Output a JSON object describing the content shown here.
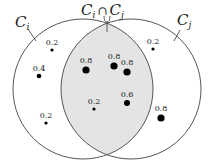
{
  "diagram": {
    "type": "venn",
    "sets": [
      {
        "id": "ci",
        "label": "C",
        "sub": "i"
      },
      {
        "id": "cj",
        "label": "C",
        "sub": "j"
      }
    ],
    "intersection_label": {
      "a": "C",
      "a_sub": "i",
      "op": "∩",
      "b": "C",
      "b_sub": "j"
    },
    "colors": {
      "stroke": "#555555",
      "intersection_fill": "#e4e4e4",
      "point": "#000000"
    },
    "points": [
      {
        "region": "ci_only",
        "value": "0.2",
        "x": 52,
        "y": 50,
        "r": 1.6
      },
      {
        "region": "ci_only",
        "value": "0.4",
        "x": 39,
        "y": 76,
        "r": 2.3
      },
      {
        "region": "ci_only",
        "value": "0.2",
        "x": 46,
        "y": 123,
        "r": 1.6
      },
      {
        "region": "intersection",
        "value": "0.8",
        "x": 86,
        "y": 70,
        "r": 3.6
      },
      {
        "region": "intersection",
        "value": "0.8",
        "x": 114,
        "y": 66,
        "r": 3.6
      },
      {
        "region": "intersection",
        "value": "0.8",
        "x": 127,
        "y": 72,
        "r": 3.6
      },
      {
        "region": "intersection",
        "value": "0.2",
        "x": 94,
        "y": 109,
        "r": 1.6
      },
      {
        "region": "intersection",
        "value": "0.6",
        "x": 127,
        "y": 103,
        "r": 3.0
      },
      {
        "region": "cj_only",
        "value": "0.2",
        "x": 153,
        "y": 49,
        "r": 1.6
      },
      {
        "region": "cj_only",
        "value": "0.8",
        "x": 161,
        "y": 118,
        "r": 3.6
      }
    ]
  }
}
